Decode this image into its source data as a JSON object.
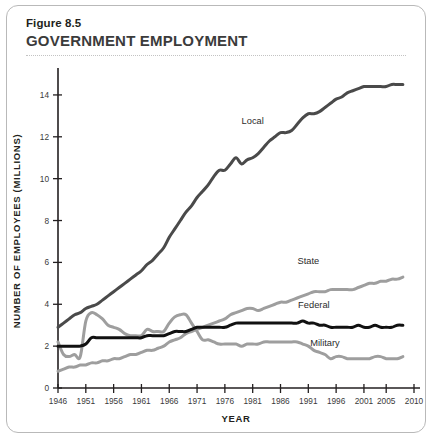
{
  "figure": {
    "number_label": "Figure 8.5",
    "title": "GOVERNMENT EMPLOYMENT"
  },
  "chart_data": {
    "type": "line",
    "title": "GOVERNMENT EMPLOYMENT",
    "xlabel": "YEAR",
    "ylabel": "NUMBER OF EMPLOYEES (MILLIONS)",
    "xlim": [
      1946,
      2010
    ],
    "ylim": [
      0,
      15
    ],
    "yticks": [
      0,
      2,
      4,
      6,
      8,
      10,
      12,
      14
    ],
    "ytick_labels": [
      "0",
      "2",
      "4",
      "6",
      "8",
      "10",
      "12",
      "14"
    ],
    "xticks": [
      1946,
      1951,
      1956,
      1961,
      1966,
      1971,
      1976,
      1981,
      1986,
      1991,
      1996,
      2001,
      2005,
      2010
    ],
    "xtick_labels": [
      "1946",
      "1951",
      "1956",
      "1961",
      "1966",
      "1971",
      "1976",
      "1981",
      "1986",
      "1991",
      "1996",
      "2001",
      "2005",
      "2010"
    ],
    "grid": false,
    "legend": "inline-labels",
    "x": [
      1946,
      1947,
      1948,
      1949,
      1950,
      1951,
      1952,
      1953,
      1954,
      1955,
      1956,
      1957,
      1958,
      1959,
      1960,
      1961,
      1962,
      1963,
      1964,
      1965,
      1966,
      1967,
      1968,
      1969,
      1970,
      1971,
      1972,
      1973,
      1974,
      1975,
      1976,
      1977,
      1978,
      1979,
      1980,
      1981,
      1982,
      1983,
      1984,
      1985,
      1986,
      1987,
      1988,
      1989,
      1990,
      1991,
      1992,
      1993,
      1994,
      1995,
      1996,
      1997,
      1998,
      1999,
      2000,
      2001,
      2002,
      2003,
      2004,
      2005,
      2006,
      2007,
      2008
    ],
    "series": [
      {
        "name": "Local",
        "color": "#4a4a4a",
        "width": 3.0,
        "label_x": 1981,
        "label_y": 12.6,
        "values": [
          2.9,
          3.1,
          3.3,
          3.5,
          3.6,
          3.8,
          3.9,
          4.0,
          4.2,
          4.4,
          4.6,
          4.8,
          5.0,
          5.2,
          5.4,
          5.6,
          5.9,
          6.1,
          6.4,
          6.7,
          7.2,
          7.6,
          8.0,
          8.4,
          8.7,
          9.1,
          9.4,
          9.7,
          10.1,
          10.4,
          10.4,
          10.7,
          11.0,
          10.7,
          10.9,
          11.0,
          11.2,
          11.5,
          11.8,
          12.0,
          12.2,
          12.2,
          12.3,
          12.6,
          12.9,
          13.1,
          13.1,
          13.2,
          13.4,
          13.6,
          13.8,
          13.9,
          14.1,
          14.2,
          14.3,
          14.4,
          14.4,
          14.4,
          14.4,
          14.4,
          14.5,
          14.5,
          14.5
        ]
      },
      {
        "name": "State",
        "color": "#9e9e9e",
        "width": 3.0,
        "label_x": 1991,
        "label_y": 5.9,
        "values": [
          0.8,
          0.9,
          1.0,
          1.0,
          1.1,
          1.1,
          1.2,
          1.2,
          1.3,
          1.3,
          1.4,
          1.4,
          1.5,
          1.6,
          1.6,
          1.7,
          1.8,
          1.8,
          1.9,
          2.0,
          2.2,
          2.3,
          2.4,
          2.6,
          2.7,
          2.8,
          2.9,
          3.0,
          3.1,
          3.2,
          3.3,
          3.5,
          3.6,
          3.7,
          3.8,
          3.8,
          3.7,
          3.8,
          3.9,
          4.0,
          4.1,
          4.1,
          4.2,
          4.3,
          4.4,
          4.5,
          4.6,
          4.6,
          4.6,
          4.7,
          4.7,
          4.7,
          4.7,
          4.7,
          4.8,
          4.9,
          5.0,
          5.0,
          5.1,
          5.1,
          5.2,
          5.2,
          5.3
        ]
      },
      {
        "name": "Federal",
        "color": "#111111",
        "width": 3.0,
        "label_x": 1992,
        "label_y": 3.8,
        "values": [
          2.0,
          2.0,
          2.0,
          2.0,
          2.0,
          2.1,
          2.4,
          2.4,
          2.4,
          2.4,
          2.4,
          2.4,
          2.4,
          2.4,
          2.4,
          2.4,
          2.5,
          2.5,
          2.5,
          2.5,
          2.6,
          2.7,
          2.7,
          2.7,
          2.8,
          2.9,
          2.9,
          2.9,
          2.9,
          2.9,
          2.9,
          3.0,
          3.1,
          3.1,
          3.1,
          3.1,
          3.1,
          3.1,
          3.1,
          3.1,
          3.1,
          3.1,
          3.1,
          3.1,
          3.2,
          3.1,
          3.1,
          3.0,
          3.0,
          2.9,
          2.9,
          2.9,
          2.9,
          2.9,
          3.0,
          2.9,
          2.9,
          3.0,
          2.9,
          2.9,
          2.9,
          3.0,
          3.0
        ]
      },
      {
        "name": "Military",
        "color": "#9e9e9e",
        "width": 3.0,
        "label_x": 1994,
        "label_y": 2.0,
        "values": [
          2.2,
          1.6,
          1.5,
          1.6,
          1.5,
          3.2,
          3.6,
          3.5,
          3.3,
          3.0,
          2.9,
          2.8,
          2.6,
          2.5,
          2.5,
          2.5,
          2.8,
          2.7,
          2.7,
          2.7,
          3.1,
          3.4,
          3.5,
          3.5,
          3.1,
          2.7,
          2.3,
          2.3,
          2.2,
          2.1,
          2.1,
          2.1,
          2.1,
          2.0,
          2.1,
          2.1,
          2.1,
          2.2,
          2.2,
          2.2,
          2.2,
          2.2,
          2.2,
          2.2,
          2.1,
          2.0,
          1.8,
          1.7,
          1.6,
          1.4,
          1.5,
          1.5,
          1.4,
          1.4,
          1.4,
          1.4,
          1.4,
          1.5,
          1.5,
          1.4,
          1.4,
          1.4,
          1.5
        ]
      }
    ]
  }
}
